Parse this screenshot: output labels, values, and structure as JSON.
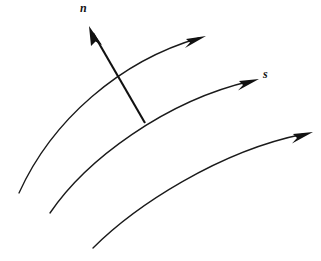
{
  "figure": {
    "background_color": "#ffffff",
    "line_color": "#1a1a1a",
    "width": 321,
    "height": 261,
    "labels": {
      "normal": "n",
      "tangential": "s"
    },
    "elements": {
      "streamline_top_name": "streamline-top",
      "streamline_middle_name": "streamline-middle",
      "streamline_bottom_name": "streamline-bottom",
      "normal_vector_name": "normal-vector",
      "tangent_label_name": "tangent-label"
    },
    "geometry": {
      "streamline_top": {
        "start": [
          19,
          193
        ],
        "control1": [
          52,
          120
        ],
        "control2": [
          120,
          61
        ],
        "end": [
          199,
          38
        ],
        "arrow_tip": [
          206,
          36
        ],
        "arrow_angle_deg": -16
      },
      "streamline_middle": {
        "start": [
          50,
          213
        ],
        "control1": [
          86,
          160
        ],
        "control2": [
          165,
          101
        ],
        "end": [
          251,
          81
        ],
        "arrow_tip": [
          259,
          79
        ],
        "arrow_angle_deg": -14
      },
      "streamline_bottom": {
        "start": [
          93,
          248
        ],
        "control1": [
          135,
          206
        ],
        "control2": [
          219,
          151
        ],
        "end": [
          304,
          134
        ],
        "arrow_tip": [
          313,
          132
        ],
        "arrow_angle_deg": -12
      },
      "normal_vector": {
        "tail": [
          145,
          123
        ],
        "tip": [
          89,
          26
        ],
        "crosses_top_streamline_at": [
          118,
          79
        ],
        "arrow_angle_deg": -120
      }
    }
  }
}
